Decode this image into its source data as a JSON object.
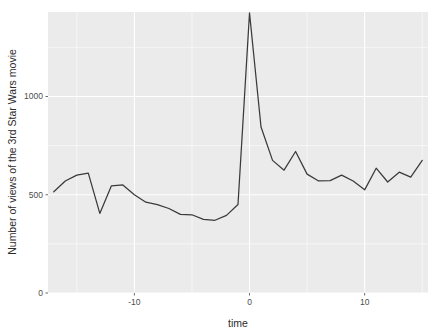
{
  "chart_data": {
    "type": "line",
    "title": "",
    "subtitle": "",
    "xlabel": "time",
    "ylabel": "Number of views of the 3rd Star Wars movie",
    "xlim": [
      -17.5,
      15.5
    ],
    "ylim": [
      0,
      1430
    ],
    "xticks": [
      -10,
      0,
      10
    ],
    "xtick_labels": [
      "-10",
      "0",
      "10"
    ],
    "yticks": [
      0,
      500,
      1000
    ],
    "ytick_labels": [
      "0",
      "500",
      "1000"
    ],
    "grid": true,
    "grid_major_color": "#ffffff",
    "panel_background": "#ebebeb",
    "line_color": "#3a3a3a",
    "legend": null,
    "legend_position": "none",
    "annotations": [],
    "series": [
      {
        "name": "views",
        "x": [
          -17,
          -16,
          -15,
          -14,
          -13,
          -12,
          -11,
          -10,
          -9,
          -8,
          -7,
          -6,
          -5,
          -4,
          -3,
          -2,
          -1,
          0,
          1,
          2,
          3,
          4,
          5,
          6,
          7,
          8,
          9,
          10,
          11,
          12,
          13,
          14,
          15
        ],
        "values": [
          515,
          570,
          600,
          610,
          405,
          545,
          550,
          500,
          462,
          450,
          430,
          400,
          398,
          375,
          370,
          395,
          450,
          1425,
          845,
          675,
          625,
          720,
          605,
          570,
          572,
          600,
          570,
          525,
          635,
          565,
          615,
          590,
          675
        ]
      }
    ]
  },
  "axis": {
    "x_title": "time",
    "y_title": "Number of views of the 3rd Star Wars movie"
  }
}
